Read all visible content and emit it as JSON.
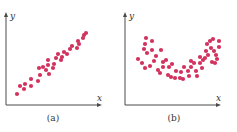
{
  "colors": {
    "dot": "#d2335e",
    "axis": "#4a4a4a",
    "text": "#333333"
  },
  "chart_data": [
    {
      "type": "scatter",
      "title": "",
      "caption": "(a)",
      "xlabel": "x",
      "ylabel": "y",
      "grid": false,
      "ticks": false,
      "description": "Strong positive linear correlation",
      "points_px": [
        [
          17,
          94
        ],
        [
          20,
          86
        ],
        [
          24,
          89
        ],
        [
          25,
          84
        ],
        [
          31,
          86
        ],
        [
          31,
          79
        ],
        [
          38,
          81
        ],
        [
          40,
          75
        ],
        [
          39,
          68
        ],
        [
          43,
          67
        ],
        [
          46,
          70
        ],
        [
          48,
          65
        ],
        [
          48,
          60
        ],
        [
          49,
          74
        ],
        [
          53,
          68
        ],
        [
          54,
          64
        ],
        [
          56,
          58
        ],
        [
          58,
          54
        ],
        [
          61,
          60
        ],
        [
          62,
          57
        ],
        [
          64,
          52
        ],
        [
          67,
          54
        ],
        [
          70,
          49
        ],
        [
          72,
          46
        ],
        [
          77,
          48
        ],
        [
          78,
          41
        ],
        [
          79,
          44
        ],
        [
          83,
          38
        ],
        [
          84,
          35
        ],
        [
          86,
          33
        ]
      ]
    },
    {
      "type": "scatter",
      "title": "",
      "caption": "(b)",
      "xlabel": "x",
      "ylabel": "y",
      "grid": false,
      "ticks": false,
      "description": "Nonlinear U-shaped (quadratic) relationship",
      "points_px": [
        [
          138,
          59
        ],
        [
          142,
          63
        ],
        [
          145,
          68
        ],
        [
          144,
          49
        ],
        [
          145,
          44
        ],
        [
          147,
          53
        ],
        [
          146,
          38
        ],
        [
          152,
          41
        ],
        [
          150,
          66
        ],
        [
          152,
          50
        ],
        [
          156,
          56
        ],
        [
          154,
          61
        ],
        [
          158,
          70
        ],
        [
          161,
          50
        ],
        [
          163,
          62
        ],
        [
          160,
          73
        ],
        [
          166,
          60
        ],
        [
          168,
          75
        ],
        [
          163,
          67
        ],
        [
          169,
          67
        ],
        [
          172,
          64
        ],
        [
          171,
          77
        ],
        [
          176,
          71
        ],
        [
          175,
          78
        ],
        [
          180,
          78
        ],
        [
          181,
          72
        ],
        [
          184,
          67
        ],
        [
          183,
          79
        ],
        [
          188,
          71
        ],
        [
          189,
          76
        ],
        [
          191,
          61
        ],
        [
          191,
          67
        ],
        [
          194,
          63
        ],
        [
          196,
          71
        ],
        [
          197,
          76
        ],
        [
          200,
          63
        ],
        [
          200,
          57
        ],
        [
          203,
          60
        ],
        [
          202,
          68
        ],
        [
          205,
          58
        ],
        [
          206,
          51
        ],
        [
          207,
          44
        ],
        [
          208,
          55
        ],
        [
          210,
          41
        ],
        [
          211,
          48
        ],
        [
          212,
          62
        ],
        [
          213,
          39
        ],
        [
          214,
          51
        ],
        [
          216,
          55
        ],
        [
          217,
          59
        ],
        [
          219,
          41
        ],
        [
          219,
          47
        ],
        [
          215,
          63
        ]
      ]
    }
  ]
}
